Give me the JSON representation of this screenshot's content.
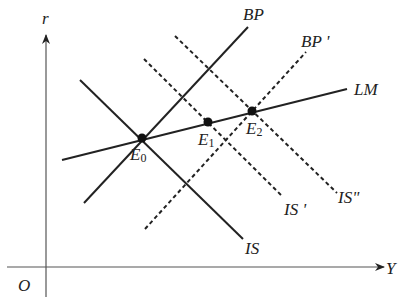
{
  "diagram": {
    "type": "IS-LM-BP macroeconomic diagram",
    "colors": {
      "line": "#222222",
      "axis": "#555555",
      "background": "#ffffff"
    },
    "axes": {
      "y_label": "r",
      "x_label": "Y",
      "origin_label": "O"
    },
    "curves": [
      {
        "id": "LM",
        "label": "LM",
        "style": "solid"
      },
      {
        "id": "BP",
        "label": "BP",
        "style": "solid"
      },
      {
        "id": "BP_prime",
        "label": "BP '",
        "style": "dashed"
      },
      {
        "id": "IS",
        "label": "IS",
        "style": "solid"
      },
      {
        "id": "IS_prime",
        "label": "IS '",
        "style": "dashed"
      },
      {
        "id": "IS_dprime",
        "label": "IS\"",
        "style": "dashed"
      }
    ],
    "points": [
      {
        "id": "E0",
        "letter": "E",
        "sub": "0"
      },
      {
        "id": "E1",
        "letter": "E",
        "sub": "1"
      },
      {
        "id": "E2",
        "letter": "E",
        "sub": "2"
      }
    ]
  }
}
